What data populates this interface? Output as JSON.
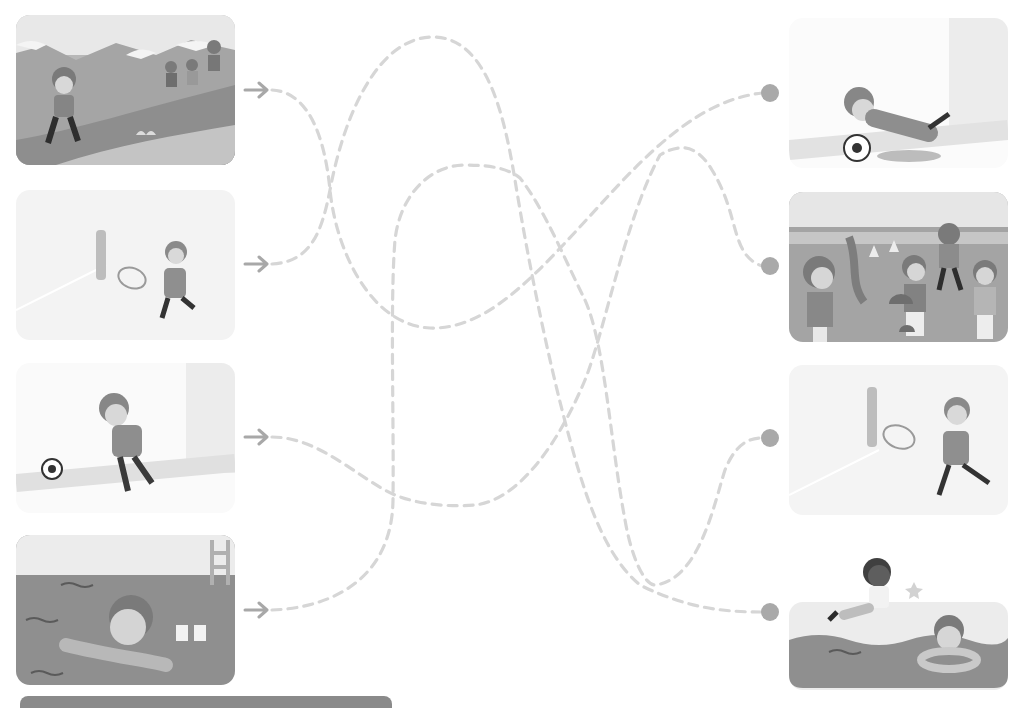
{
  "puzzle": {
    "type": "follow-the-path matching",
    "colors": {
      "path": "#d6d6d6",
      "arrow": "#a8a8a8",
      "dot": "#a9a9a9",
      "card_dark": "#8f8f8f",
      "card_mid": "#b4b4b4",
      "card_light": "#ededed"
    }
  },
  "left_cards": [
    {
      "id": "L1",
      "scene": "children hiking on a mountain trail"
    },
    {
      "id": "L2",
      "scene": "girl with glasses playing tennis near net"
    },
    {
      "id": "L3",
      "scene": "girl with pigtails kicking a soccer ball at goal"
    },
    {
      "id": "L4",
      "scene": "boy struggling in a swimming pool with floating armbands"
    }
  ],
  "right_cards": [
    {
      "id": "R1",
      "scene": "goalkeeper girl diving to save a soccer ball"
    },
    {
      "id": "R2",
      "scene": "group of children pointing in a field"
    },
    {
      "id": "R3",
      "scene": "girl with glasses running with tennis racket"
    },
    {
      "id": "R4",
      "scene": "girl jumping into pool next to smiling boy in swim ring"
    }
  ],
  "connections": [
    {
      "from": "L1",
      "to": "R1"
    },
    {
      "from": "L2",
      "to": "R4"
    },
    {
      "from": "L3",
      "to": "R2"
    },
    {
      "from": "L4",
      "to": "R3"
    }
  ],
  "icons": {
    "start_marker": "arrow-right-icon",
    "end_marker": "circle-dot-icon"
  }
}
